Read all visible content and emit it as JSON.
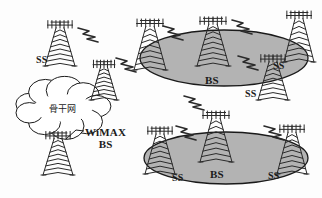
{
  "diagram": {
    "colors": {
      "cell_fill": "#b3b3b3",
      "cell_stroke": "#1a1a1a",
      "tower_stroke": "#2a2a2a",
      "text": "#1b1b1b",
      "background": "#ffffff"
    },
    "cloud": {
      "label": "骨干网",
      "name": "backbone-network-cloud",
      "cx": 63,
      "cy": 108,
      "rx": 42,
      "ry": 22
    },
    "callout": {
      "line1": "WiMAX",
      "line2": "BS",
      "x": 85,
      "y": 126
    },
    "cells": [
      {
        "id": "cell-top",
        "cx": 224,
        "cy": 58,
        "rx": 84,
        "ry": 28
      },
      {
        "id": "cell-bottom",
        "cx": 226,
        "cy": 158,
        "rx": 82,
        "ry": 26
      }
    ],
    "towers": [
      {
        "id": "tower-ss-left",
        "label": "SS",
        "x": 60,
        "y": 22,
        "h": 44,
        "w": 30,
        "label_dx": -24,
        "label_dy": 32,
        "in_cell": false
      },
      {
        "id": "tower-relay-middle",
        "label": "",
        "x": 104,
        "y": 62,
        "h": 38,
        "w": 26,
        "label_dx": 0,
        "label_dy": 0,
        "in_cell": false
      },
      {
        "id": "tower-wimax-bs",
        "label": "",
        "x": 58,
        "y": 133,
        "h": 42,
        "w": 30,
        "label_dx": 0,
        "label_dy": 0,
        "in_cell": false
      },
      {
        "id": "tower-top-edge-left",
        "label": "",
        "x": 150,
        "y": 20,
        "h": 50,
        "w": 32,
        "label_dx": 0,
        "label_dy": 0,
        "in_cell": true
      },
      {
        "id": "tower-top-bs",
        "label": "BS",
        "x": 213,
        "y": 18,
        "h": 48,
        "w": 32,
        "label_dx": -8,
        "label_dy": 56,
        "in_cell": true
      },
      {
        "id": "tower-top-ss-inner",
        "label": "SS",
        "x": 273,
        "y": 56,
        "h": 44,
        "w": 30,
        "label_dx": -28,
        "label_dy": 32,
        "in_cell": true
      },
      {
        "id": "tower-top-ss-right",
        "label": "SS",
        "x": 299,
        "y": 12,
        "h": 50,
        "w": 30,
        "label_dx": -26,
        "label_dy": 48,
        "in_cell": true
      },
      {
        "id": "tower-bot-ss-left",
        "label": "SS",
        "x": 160,
        "y": 128,
        "h": 46,
        "w": 30,
        "label_dx": 12,
        "label_dy": 44,
        "in_cell": true
      },
      {
        "id": "tower-bot-bs",
        "label": "BS",
        "x": 216,
        "y": 112,
        "h": 50,
        "w": 32,
        "label_dx": -6,
        "label_dy": 56,
        "in_cell": true
      },
      {
        "id": "tower-bot-ss-right",
        "label": "SS",
        "x": 292,
        "y": 126,
        "h": 48,
        "w": 30,
        "label_dx": -24,
        "label_dy": 44,
        "in_cell": true
      }
    ],
    "links": [
      {
        "id": "link-ss-left-to-cell",
        "x": 78,
        "y": 28
      },
      {
        "id": "link-relay-to-cell",
        "x": 116,
        "y": 58
      },
      {
        "id": "link-top-bs-left",
        "x": 163,
        "y": 26
      },
      {
        "id": "link-top-bs-right",
        "x": 232,
        "y": 20
      },
      {
        "id": "link-top-to-ss",
        "x": 238,
        "y": 56
      },
      {
        "id": "link-mid-vertical",
        "x": 184,
        "y": 96
      },
      {
        "id": "link-bot-left",
        "x": 176,
        "y": 126
      },
      {
        "id": "link-bot-right",
        "x": 264,
        "y": 126
      }
    ]
  }
}
